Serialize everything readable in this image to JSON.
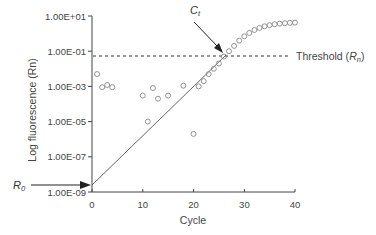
{
  "chart_data": {
    "type": "scatter",
    "title": "",
    "xlabel": "Cycle",
    "ylabel": "Log fluorescence (Rn)",
    "xlim": [
      0,
      40
    ],
    "ylim_log10": [
      -9,
      1
    ],
    "y_scale": "log",
    "grid": false,
    "x_ticks": [
      "0",
      "10",
      "20",
      "30",
      "40"
    ],
    "y_ticks": [
      "1.00E+01",
      "1.00E-01",
      "1.00E-03",
      "1.00E-05",
      "1.00E-07",
      "1.00E-09"
    ],
    "series": [
      {
        "name": "Fluorescence readings",
        "marker": "open-circle",
        "points": [
          [
            1,
            0.005
          ],
          [
            2,
            0.0009
          ],
          [
            3,
            0.0012
          ],
          [
            4,
            0.0009
          ],
          [
            10,
            0.0003
          ],
          [
            11,
            1e-05
          ],
          [
            12,
            0.0008
          ],
          [
            13,
            0.0002
          ],
          [
            15,
            0.0003
          ],
          [
            18,
            0.0011
          ],
          [
            20,
            2e-06
          ],
          [
            21,
            0.001
          ],
          [
            22,
            0.002
          ],
          [
            23,
            0.005
          ],
          [
            24,
            0.01
          ],
          [
            25,
            0.02
          ],
          [
            26,
            0.05
          ],
          [
            27,
            0.1
          ],
          [
            28,
            0.2
          ],
          [
            29,
            0.4
          ],
          [
            30,
            0.7
          ],
          [
            31,
            1.1
          ],
          [
            32,
            1.6
          ],
          [
            33,
            2.1
          ],
          [
            34,
            2.6
          ],
          [
            35,
            3.0
          ],
          [
            36,
            3.4
          ],
          [
            37,
            3.7
          ],
          [
            38,
            3.9
          ],
          [
            39,
            4.1
          ],
          [
            40,
            4.2
          ]
        ]
      },
      {
        "name": "Extrapolated exponential phase",
        "style": "solid-line",
        "points": [
          [
            0,
            2e-09
          ],
          [
            27,
            0.1
          ]
        ]
      }
    ],
    "threshold": {
      "label": "Threshold",
      "label_symbol": "R",
      "label_sub": "n",
      "value": 0.05,
      "style": "dashed"
    },
    "annotations": [
      {
        "label": "C",
        "sub": "t",
        "points_to_cycle": 26,
        "description": "Threshold cycle"
      },
      {
        "label": "R",
        "sub": "0",
        "points_to_y": 2e-09,
        "description": "Initial fluorescence"
      }
    ]
  }
}
